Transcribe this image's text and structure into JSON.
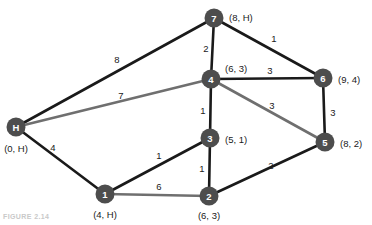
{
  "figure": {
    "caption": "FIGURE 2.14",
    "colors": {
      "node_fill": "#4d4d4d",
      "node_text": "#ffffff",
      "edge_black": "#1a1a1a",
      "edge_gray": "#6f6f6f",
      "background": "#ffffff",
      "label_text": "#1a1a1a"
    }
  },
  "chart_data": {
    "type": "diagram",
    "subtype": "weighted-undirected-graph",
    "nodes": [
      {
        "id": "H",
        "name": "H",
        "x": 16,
        "y": 127,
        "label": "(0, H)",
        "label_pos": "below",
        "label_x": 16,
        "label_y": 148
      },
      {
        "id": "1",
        "name": "1",
        "x": 105,
        "y": 194,
        "label": "(4, H)",
        "label_pos": "below",
        "label_x": 105,
        "label_y": 214
      },
      {
        "id": "2",
        "name": "2",
        "x": 209,
        "y": 196,
        "label": "(6, 3)",
        "label_pos": "below",
        "label_x": 209,
        "label_y": 215
      },
      {
        "id": "3",
        "name": "3",
        "x": 210,
        "y": 138,
        "label": "(5, 1)",
        "label_pos": "right",
        "label_x": 225,
        "label_y": 139
      },
      {
        "id": "4",
        "name": "4",
        "x": 211,
        "y": 79,
        "label": "(6, 3)",
        "label_pos": "above-right",
        "label_x": 225,
        "label_y": 68
      },
      {
        "id": "5",
        "name": "5",
        "x": 325,
        "y": 142,
        "label": "(8, 2)",
        "label_pos": "right",
        "label_x": 340,
        "label_y": 143
      },
      {
        "id": "6",
        "name": "6",
        "x": 323,
        "y": 78,
        "label": "(9, 4)",
        "label_pos": "right",
        "label_x": 338,
        "label_y": 79
      },
      {
        "id": "7",
        "name": "7",
        "x": 214,
        "y": 18,
        "label": "(8, H)",
        "label_pos": "right",
        "label_x": 229,
        "label_y": 17
      }
    ],
    "edges": [
      {
        "from": "H",
        "to": "7",
        "weight": "8",
        "color": "edge_black",
        "label_x": 117,
        "label_y": 59
      },
      {
        "from": "H",
        "to": "4",
        "weight": "7",
        "color": "edge_gray",
        "label_x": 121,
        "label_y": 95
      },
      {
        "from": "H",
        "to": "1",
        "weight": "4",
        "color": "edge_black",
        "label_x": 53,
        "label_y": 147
      },
      {
        "from": "7",
        "to": "4",
        "weight": "2",
        "color": "edge_black",
        "label_x": 206,
        "label_y": 48
      },
      {
        "from": "7",
        "to": "6",
        "weight": "1",
        "color": "edge_black",
        "label_x": 274,
        "label_y": 38
      },
      {
        "from": "4",
        "to": "6",
        "weight": "3",
        "color": "edge_black",
        "label_x": 270,
        "label_y": 70
      },
      {
        "from": "4",
        "to": "3",
        "weight": "1",
        "color": "edge_black",
        "label_x": 203,
        "label_y": 110
      },
      {
        "from": "4",
        "to": "5",
        "weight": "3",
        "color": "edge_gray",
        "label_x": 272,
        "label_y": 105
      },
      {
        "from": "6",
        "to": "5",
        "weight": "3",
        "color": "edge_black",
        "label_x": 333,
        "label_y": 112
      },
      {
        "from": "3",
        "to": "1",
        "weight": "1",
        "color": "edge_black",
        "label_x": 159,
        "label_y": 155
      },
      {
        "from": "3",
        "to": "2",
        "weight": "1",
        "color": "edge_black",
        "label_x": 202,
        "label_y": 168
      },
      {
        "from": "1",
        "to": "2",
        "weight": "6",
        "color": "edge_gray",
        "label_x": 159,
        "label_y": 186
      },
      {
        "from": "2",
        "to": "5",
        "weight": "2",
        "color": "edge_black",
        "label_x": 271,
        "label_y": 165
      }
    ],
    "node_radius": 9.5,
    "legend": [],
    "xlabel": "",
    "ylabel": ""
  }
}
